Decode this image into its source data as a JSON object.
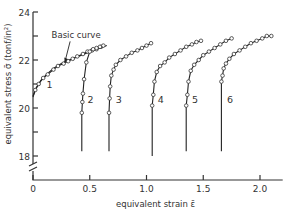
{
  "chart_data": {
    "type": "line",
    "title": "",
    "xlabel": "equivalent strain ε̄",
    "ylabel": "equivalent stress σ̄ (tonf/in²)",
    "xlim": [
      0,
      2.2
    ],
    "ylim": [
      18,
      24
    ],
    "y_axis_break": true,
    "grid": false,
    "legend": "none",
    "x_ticks": [
      0,
      0.5,
      1.0,
      1.5,
      2.0
    ],
    "x_tick_labels": [
      "0",
      "0.5",
      "1.0",
      "1.5",
      "2.0"
    ],
    "y_ticks": [
      18,
      19,
      20,
      21,
      22,
      23,
      24
    ],
    "y_tick_labels": [
      "18",
      "",
      "20",
      "",
      "22",
      "",
      "24"
    ],
    "annotations": [
      {
        "text": "Basic curve",
        "x": 0.38,
        "y": 22.9,
        "arrow_to": [
          0.28,
          21.9
        ]
      },
      {
        "text": "1",
        "x": 0.12,
        "y": 20.85
      },
      {
        "text": "2",
        "x": 0.48,
        "y": 20.2
      },
      {
        "text": "3",
        "x": 0.73,
        "y": 20.2
      },
      {
        "text": "4",
        "x": 1.1,
        "y": 20.2
      },
      {
        "text": "5",
        "x": 1.4,
        "y": 20.2
      },
      {
        "text": "6",
        "x": 1.71,
        "y": 20.2
      }
    ],
    "series": [
      {
        "name": "Basic curve",
        "style": "line",
        "x": [
          0.0,
          0.03,
          0.07,
          0.12,
          0.18,
          0.25,
          0.32,
          0.4,
          0.48,
          0.56,
          0.65
        ],
        "y": [
          20.5,
          20.85,
          21.15,
          21.4,
          21.65,
          21.85,
          22.0,
          22.15,
          22.3,
          22.45,
          22.6
        ]
      },
      {
        "name": "1",
        "x": [
          0.0,
          0.02,
          0.05,
          0.09,
          0.13,
          0.18,
          0.22,
          0.27,
          0.31,
          0.35,
          0.39,
          0.44,
          0.48,
          0.52,
          0.56,
          0.6
        ],
        "y": [
          20.45,
          20.75,
          21.0,
          21.25,
          21.4,
          21.6,
          21.75,
          21.85,
          21.95,
          22.05,
          22.15,
          22.25,
          22.35,
          22.4,
          22.45,
          22.55
        ]
      },
      {
        "name": "2",
        "x": [
          0.43,
          0.43,
          0.435,
          0.44,
          0.45,
          0.47,
          0.5,
          0.53,
          0.56,
          0.59,
          0.62
        ],
        "y": [
          18.2,
          19.8,
          20.25,
          20.6,
          21.2,
          21.9,
          22.35,
          22.45,
          22.5,
          22.55,
          22.6
        ]
      },
      {
        "name": "3",
        "x": [
          0.67,
          0.67,
          0.675,
          0.68,
          0.69,
          0.71,
          0.73,
          0.77,
          0.82,
          0.87,
          0.92,
          0.96,
          1.0,
          1.04
        ],
        "y": [
          18.2,
          19.8,
          20.4,
          20.9,
          21.35,
          21.6,
          21.8,
          22.0,
          22.15,
          22.3,
          22.4,
          22.5,
          22.6,
          22.7
        ]
      },
      {
        "name": "4",
        "x": [
          1.05,
          1.05,
          1.06,
          1.07,
          1.09,
          1.12,
          1.16,
          1.2,
          1.25,
          1.3,
          1.35,
          1.4,
          1.44,
          1.48
        ],
        "y": [
          18.0,
          20.1,
          20.55,
          21.1,
          21.5,
          21.75,
          21.9,
          22.1,
          22.25,
          22.4,
          22.55,
          22.65,
          22.75,
          22.8
        ]
      },
      {
        "name": "5",
        "x": [
          1.35,
          1.35,
          1.36,
          1.37,
          1.39,
          1.42,
          1.46,
          1.5,
          1.55,
          1.6,
          1.65,
          1.7,
          1.75
        ],
        "y": [
          18.2,
          20.1,
          20.55,
          21.1,
          21.55,
          21.8,
          22.0,
          22.2,
          22.35,
          22.5,
          22.65,
          22.8,
          22.9
        ]
      },
      {
        "name": "6",
        "x": [
          1.66,
          1.66,
          1.67,
          1.68,
          1.7,
          1.73,
          1.77,
          1.82,
          1.87,
          1.92,
          1.97,
          2.02,
          2.06,
          2.1
        ],
        "y": [
          18.2,
          21.1,
          21.35,
          21.65,
          21.85,
          22.05,
          22.25,
          22.4,
          22.55,
          22.7,
          22.8,
          22.9,
          23.0,
          23.0
        ]
      }
    ]
  }
}
